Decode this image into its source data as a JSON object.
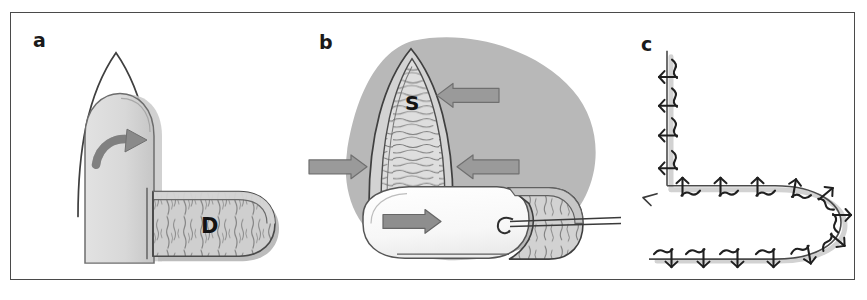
{
  "figure": {
    "type": "surgical-technique-diagram",
    "panel_count": 3,
    "border_color": "#4a4a4a",
    "background_color": "#ffffff"
  },
  "palette": {
    "outline": "#3d3d3d",
    "outline_light": "#6e6e6e",
    "blob_gray": "#b9b9b9",
    "flap_gray": "#d7d7d7",
    "flap_gray_dark": "#c2c2c2",
    "hatch_gray": "#cfcfcf",
    "hatch_stroke": "#7b7b7b",
    "arrow_fill": "#9a9a9a",
    "arrow_stroke": "#6a6a6a",
    "white_flap": "#fafafa",
    "suture_dark": "#222222",
    "suture_line": "#555555",
    "shadow_gray": "#cccccc"
  },
  "panels": [
    {
      "id": "a",
      "label": "a",
      "label_x": 32,
      "label_y": 40,
      "description": "V-shaped defect outline with advancing rounded flap, rotation arrow, and horizontal donor flap",
      "tissue_labels": [
        {
          "text": "D",
          "x": 190,
          "y": 218,
          "size": 20
        }
      ],
      "arrows": [
        {
          "name": "rotation-arrow",
          "kind": "curved",
          "direction": "clockwise-up-right"
        }
      ]
    },
    {
      "id": "b",
      "label": "b",
      "label_x": 28,
      "label_y": 42,
      "description": "Gray tissue field with pointed hatched S region, white advancement flap, suture needle and thread, four block arrows showing closure tension vectors",
      "tissue_labels": [
        {
          "text": "S",
          "x": 48,
          "y": 92,
          "size": 19
        }
      ],
      "arrows": [
        {
          "name": "arrow-upper-right",
          "kind": "block",
          "direction": "left",
          "x": 140,
          "y": 83,
          "length": 58
        },
        {
          "name": "arrow-left",
          "kind": "block",
          "direction": "right",
          "x": 8,
          "y": 155,
          "length": 52
        },
        {
          "name": "arrow-middle-right",
          "kind": "block",
          "direction": "left",
          "x": 158,
          "y": 155,
          "length": 58
        },
        {
          "name": "arrow-lower-center",
          "kind": "block",
          "direction": "right",
          "x": 80,
          "y": 210,
          "length": 56
        }
      ]
    },
    {
      "id": "c",
      "label": "c",
      "label_x": 30,
      "label_y": 44,
      "description": "Final sutured closure: vertical limb with 4 sutures meeting a horseshoe shaped incision line with 12 sutures",
      "suture_counts": {
        "vertical_limb": 4,
        "upper_horizontal": 4,
        "curve": 3,
        "lower_horizontal": 5
      },
      "tissue_labels": [],
      "arrows": []
    }
  ]
}
